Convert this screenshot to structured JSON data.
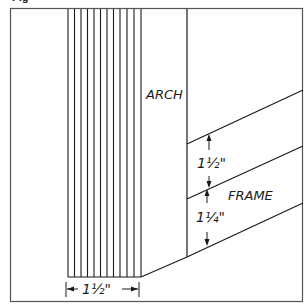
{
  "figure": {
    "caption_stub": "Fig",
    "border_color": "#555555",
    "line_color": "#1a1a1a",
    "background": "#ffffff"
  },
  "labels": {
    "arch": "ARCH",
    "frame": "FRAME",
    "arch_width": "1½\"",
    "frame_upper_thickness": "1½\"",
    "frame_lower_thickness": "1¼\""
  },
  "board": {
    "grain_line_count": 12
  }
}
